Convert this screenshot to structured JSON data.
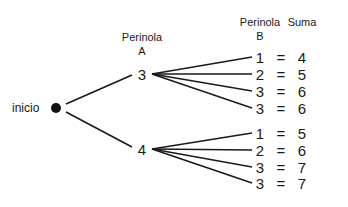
{
  "diagram": {
    "type": "tree-diagram",
    "start_label": "inicio",
    "headers": {
      "perinola_a": [
        "Perinola",
        "A"
      ],
      "perinola_b": [
        "Perinola",
        "B"
      ],
      "suma": "Suma"
    },
    "branches": [
      {
        "a_value": "3",
        "outcomes": [
          {
            "b": "1",
            "eq": "=",
            "sum": "4"
          },
          {
            "b": "2",
            "eq": "=",
            "sum": "5"
          },
          {
            "b": "3",
            "eq": "=",
            "sum": "6"
          },
          {
            "b": "3",
            "eq": "=",
            "sum": "6"
          }
        ]
      },
      {
        "a_value": "4",
        "outcomes": [
          {
            "b": "1",
            "eq": "=",
            "sum": "5"
          },
          {
            "b": "2",
            "eq": "=",
            "sum": "6"
          },
          {
            "b": "3",
            "eq": "=",
            "sum": "7"
          },
          {
            "b": "3",
            "eq": "=",
            "sum": "7"
          }
        ]
      }
    ],
    "colors": {
      "line": "#1a1a1a",
      "text": "#1a1a1a",
      "background": "#ffffff"
    }
  }
}
